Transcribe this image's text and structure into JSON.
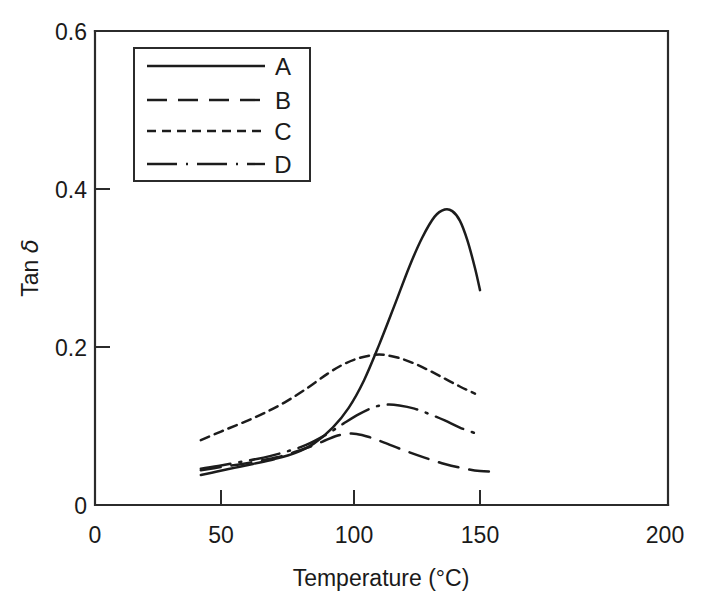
{
  "chart_data": {
    "type": "line",
    "title": "",
    "subtitle": "",
    "xlabel": "Temperature (°C)",
    "ylabel": "Tan δ",
    "xlim": [
      0,
      200
    ],
    "ylim": [
      0,
      0.6
    ],
    "xticks": [
      0,
      50,
      100,
      150,
      200
    ],
    "xticklabels": [
      "0",
      "50",
      "100",
      "150",
      "200"
    ],
    "yticks": [
      0,
      0.2,
      0.4,
      0.6
    ],
    "yticklabels": [
      "0",
      "0.2",
      "0.4",
      "0.6"
    ],
    "grid": false,
    "legend_position": "upper-left",
    "series": [
      {
        "name": "A",
        "style": "solid",
        "x": [
          42,
          48,
          55,
          62,
          70,
          78,
          85,
          92,
          98,
          104,
          110,
          116,
          122,
          127,
          132,
          136,
          139,
          142,
          145,
          148,
          150
        ],
        "y": [
          0.038,
          0.042,
          0.047,
          0.052,
          0.058,
          0.066,
          0.078,
          0.098,
          0.123,
          0.158,
          0.203,
          0.252,
          0.302,
          0.338,
          0.365,
          0.374,
          0.372,
          0.36,
          0.335,
          0.3,
          0.272
        ]
      },
      {
        "name": "B",
        "style": "long-dash",
        "x": [
          42,
          50,
          58,
          66,
          74,
          82,
          88,
          93,
          97,
          101,
          106,
          112,
          120,
          128,
          136,
          144,
          150,
          155
        ],
        "y": [
          0.044,
          0.048,
          0.052,
          0.057,
          0.063,
          0.072,
          0.08,
          0.087,
          0.09,
          0.09,
          0.086,
          0.079,
          0.069,
          0.06,
          0.052,
          0.046,
          0.043,
          0.042
        ]
      },
      {
        "name": "C",
        "style": "short-dash",
        "x": [
          42,
          50,
          58,
          66,
          74,
          82,
          90,
          96,
          102,
          108,
          112,
          118,
          124,
          130,
          136,
          142,
          148
        ],
        "y": [
          0.082,
          0.093,
          0.104,
          0.116,
          0.13,
          0.147,
          0.166,
          0.178,
          0.186,
          0.19,
          0.19,
          0.186,
          0.179,
          0.17,
          0.16,
          0.15,
          0.141
        ]
      },
      {
        "name": "D",
        "style": "dash-dot",
        "x": [
          42,
          50,
          58,
          66,
          74,
          82,
          90,
          96,
          102,
          108,
          113,
          118,
          124,
          130,
          136,
          142,
          148
        ],
        "y": [
          0.046,
          0.05,
          0.055,
          0.06,
          0.067,
          0.076,
          0.09,
          0.103,
          0.115,
          0.124,
          0.127,
          0.126,
          0.122,
          0.115,
          0.107,
          0.098,
          0.091
        ]
      }
    ]
  },
  "legend": {
    "entries": [
      {
        "label": "A",
        "style": "solid"
      },
      {
        "label": "B",
        "style": "long-dash"
      },
      {
        "label": "C",
        "style": "short-dash"
      },
      {
        "label": "D",
        "style": "dash-dot"
      }
    ]
  },
  "axes": {
    "x": {
      "label": "Temperature (°C)",
      "ticks": [
        {
          "value": 0,
          "label": "0"
        },
        {
          "value": 50,
          "label": "50"
        },
        {
          "value": 100,
          "label": "100"
        },
        {
          "value": 150,
          "label": "150"
        },
        {
          "value": 200,
          "label": "200"
        }
      ]
    },
    "y": {
      "label_prefix": "Tan ",
      "label_symbol": "δ",
      "ticks": [
        {
          "value": 0,
          "label": "0"
        },
        {
          "value": 0.2,
          "label": "0.2"
        },
        {
          "value": 0.4,
          "label": "0.4"
        },
        {
          "value": 0.6,
          "label": "0.6"
        }
      ]
    }
  },
  "colors": {
    "ink": "#1c1c1c",
    "axis": "#2b2b2b",
    "background": "#ffffff"
  }
}
